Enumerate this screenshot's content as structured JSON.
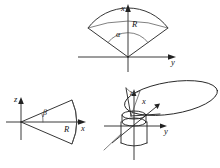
{
  "figure": {
    "background_color": "#ffffff",
    "ink_color": "#1f1f1f",
    "panels": [
      {
        "id": "top-sector",
        "name": "upward-opening-sector-xy-plane",
        "description": "Circular sector with apex at the origin opening upward about the x axis in the x-y plane",
        "axes": [
          {
            "name": "x-axis",
            "label": "x",
            "direction": "up"
          },
          {
            "name": "y-axis",
            "label": "y",
            "direction": "right"
          }
        ],
        "annotations": [
          {
            "name": "radius-label",
            "label": "R"
          },
          {
            "name": "half-angle-label",
            "label": "α"
          }
        ]
      },
      {
        "id": "bottom-left-sector",
        "name": "rightward-opening-sector-xz-plane",
        "description": "Circular sector with apex at the origin opening to the right about the x axis in the z-x plane",
        "axes": [
          {
            "name": "z-axis",
            "label": "z",
            "direction": "up"
          },
          {
            "name": "x-axis",
            "label": "x",
            "direction": "right"
          }
        ],
        "annotations": [
          {
            "name": "radius-label",
            "label": "R"
          },
          {
            "name": "half-angle-label",
            "label": "β"
          }
        ]
      },
      {
        "id": "bottom-right-perspective",
        "name": "three-dimensional-cone-over-cylinder",
        "description": "Perspective view of a wide elliptical cone opening above a cylindrical container, with x, y and z axes at the origin",
        "axes": [
          {
            "name": "z-axis",
            "label": "z",
            "direction": "up"
          },
          {
            "name": "x-axis",
            "label": "x",
            "direction": "toward-viewer"
          },
          {
            "name": "y-axis",
            "label": "y",
            "direction": "right"
          }
        ],
        "annotations": []
      }
    ],
    "labels": {
      "x": "x",
      "y": "y",
      "z": "z",
      "R": "R",
      "alpha": "α",
      "beta": "β"
    }
  }
}
